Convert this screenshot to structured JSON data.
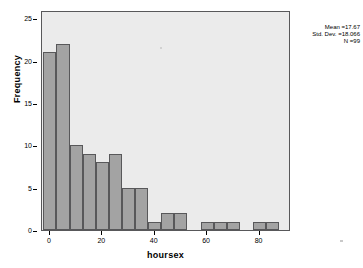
{
  "chart_data": {
    "type": "bar",
    "title": "",
    "subtitle": "",
    "xlabel": "hoursex",
    "ylabel": "Frequency",
    "xlim": [
      -3,
      92
    ],
    "ylim": [
      0,
      26
    ],
    "grid": false,
    "legend": "none",
    "bin_width": 5,
    "x_ticks": [
      0,
      20,
      40,
      60,
      80
    ],
    "x_tick_labels": [
      "0",
      "20",
      "40",
      "60",
      "80"
    ],
    "y_ticks": [
      0,
      5,
      10,
      15,
      20,
      25
    ],
    "y_tick_labels": [
      "0",
      "5",
      "10",
      "15",
      "20",
      "25"
    ],
    "bins": [
      {
        "start": -2.5,
        "end": 2.5,
        "value": 21
      },
      {
        "start": 2.5,
        "end": 7.5,
        "value": 22
      },
      {
        "start": 7.5,
        "end": 12.5,
        "value": 10
      },
      {
        "start": 12.5,
        "end": 17.5,
        "value": 9
      },
      {
        "start": 17.5,
        "end": 22.5,
        "value": 8
      },
      {
        "start": 22.5,
        "end": 27.5,
        "value": 9
      },
      {
        "start": 27.5,
        "end": 32.5,
        "value": 5
      },
      {
        "start": 32.5,
        "end": 37.5,
        "value": 5
      },
      {
        "start": 37.5,
        "end": 42.5,
        "value": 1
      },
      {
        "start": 42.5,
        "end": 47.5,
        "value": 2
      },
      {
        "start": 47.5,
        "end": 52.5,
        "value": 2
      },
      {
        "start": 57.5,
        "end": 62.5,
        "value": 1
      },
      {
        "start": 62.5,
        "end": 67.5,
        "value": 1
      },
      {
        "start": 67.5,
        "end": 72.5,
        "value": 1
      },
      {
        "start": 77.5,
        "end": 82.5,
        "value": 1
      },
      {
        "start": 82.5,
        "end": 87.5,
        "value": 1
      }
    ],
    "bar_color": "#a3a3a3",
    "bar_edge_color": "#58585a",
    "plot_background": "#ebebeb",
    "figure_background": "#ffffff"
  },
  "statistics": {
    "mean_label": "Mean =17.67",
    "std_dev_label": "Std. Dev. =18.066",
    "n_label": "N =99"
  }
}
